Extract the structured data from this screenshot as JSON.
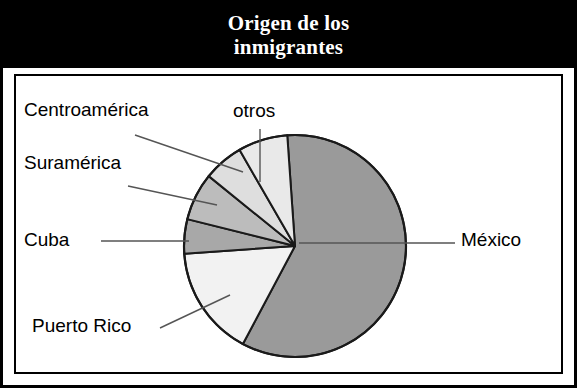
{
  "title": {
    "line1": "Origen de los",
    "line2": "inmigrantes",
    "full": "Origen de los inmigrantes"
  },
  "colors": {
    "banner_background": "#000000",
    "banner_text": "#ffffff",
    "frame": "#000000",
    "plot_background": "#ffffff",
    "slice_outline": "#1a1a1a",
    "leader_line": "#555555",
    "mexico": "#9a9a9a",
    "puerto_rico": "#f2f2f2",
    "cuba": "#a8a8a8",
    "suramerica": "#bcbcbc",
    "centroamerica": "#dedede",
    "otros": "#e9e9e9"
  },
  "labels": {
    "centroamerica": "Centroamérica",
    "suramerica": "Suramérica",
    "cuba": "Cuba",
    "puerto_rico": "Puerto Rico",
    "otros": "otros",
    "mexico": "México"
  },
  "chart_data": {
    "type": "pie",
    "title": "Origen de los inmigrantes",
    "xlabel": "",
    "ylabel": "",
    "legend": "none (direct labels with leader lines)",
    "grid": false,
    "center": {
      "x": 295,
      "y": 246
    },
    "radius": 111,
    "start_angle_deg_from_12oclock": -4,
    "direction": "clockwise",
    "categories": [
      "México",
      "Puerto Rico",
      "Cuba",
      "Suramérica",
      "Centroamérica",
      "otros"
    ],
    "values": [
      59,
      16,
      5,
      7,
      6,
      7
    ],
    "units": "percent",
    "slices": [
      {
        "label": "México",
        "value": 59,
        "color": "#9a9a9a",
        "start_deg": -4,
        "end_deg": 208,
        "label_side": "right"
      },
      {
        "label": "Puerto Rico",
        "value": 16,
        "color": "#f2f2f2",
        "start_deg": 208,
        "end_deg": 266,
        "label_side": "left"
      },
      {
        "label": "Cuba",
        "value": 5,
        "color": "#a8a8a8",
        "start_deg": 266,
        "end_deg": 284,
        "label_side": "left"
      },
      {
        "label": "Suramérica",
        "value": 7,
        "color": "#bcbcbc",
        "start_deg": 284,
        "end_deg": 309,
        "label_side": "left"
      },
      {
        "label": "Centroamérica",
        "value": 6,
        "color": "#dedede",
        "start_deg": 309,
        "end_deg": 330,
        "label_side": "left"
      },
      {
        "label": "otros",
        "value": 7,
        "color": "#e9e9e9",
        "start_deg": 330,
        "end_deg": 356,
        "label_side": "top"
      }
    ]
  }
}
